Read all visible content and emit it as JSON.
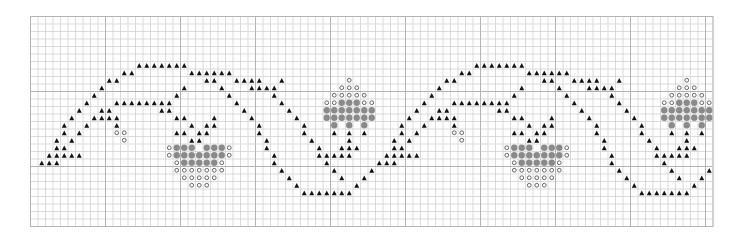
{
  "chart": {
    "columns": 91,
    "rows": 28,
    "cell_size": 7.5,
    "major_every": 10,
    "colors": {
      "background": "#ffffff",
      "grid_minor": "#d2d2d2",
      "grid_major": "#b4b4b4",
      "triangle": "#111111",
      "dot": "#8a8a8a",
      "circle_stroke": "#555555"
    },
    "legend": {
      "triangle": "black triangle stitch",
      "dot": "grey filled dot stitch",
      "circle": "open circle stitch"
    },
    "repeat_offsets": [
      0,
      45
    ],
    "motif": {
      "triangles": {
        "6": [
          14,
          15,
          16,
          17,
          18,
          19,
          20
        ],
        "7": [
          12,
          13,
          21,
          22,
          23,
          24,
          25,
          26
        ],
        "8": [
          10,
          11,
          23,
          24,
          27,
          28,
          29,
          30,
          33
        ],
        "9": [
          9,
          20,
          25,
          29,
          30,
          31,
          32
        ],
        "10": [
          8,
          19,
          26,
          32
        ],
        "11": [
          7,
          11,
          12,
          13,
          14,
          15,
          16,
          17,
          18,
          27,
          33
        ],
        "12": [
          6,
          9,
          10,
          17,
          18,
          28,
          34
        ],
        "13": [
          5,
          8,
          9,
          10,
          11,
          19,
          20,
          24,
          29,
          35
        ],
        "14": [
          4,
          7,
          11,
          21,
          23,
          24,
          30,
          36
        ],
        "15": [
          4,
          6,
          19,
          20,
          22,
          23,
          30,
          36,
          40,
          42,
          44
        ],
        "16": [
          3,
          5,
          21,
          22,
          31,
          37,
          42
        ],
        "17": [
          3,
          4,
          31,
          38,
          41,
          42,
          43
        ],
        "18": [
          2,
          3,
          4,
          5,
          6,
          32,
          38,
          39,
          40,
          41,
          42
        ],
        "19": [
          1,
          2,
          3,
          32,
          39
        ],
        "20": [
          33,
          40,
          45
        ],
        "21": [
          34,
          41,
          44
        ],
        "22": [
          35,
          43
        ],
        "23": [
          36,
          37,
          38,
          39,
          40,
          41,
          42
        ]
      },
      "dots": {
        "11": [
          41,
          42,
          43
        ],
        "12": [
          39,
          40,
          41,
          42,
          43,
          44,
          45
        ],
        "13": [
          39,
          40,
          41,
          42,
          43,
          44,
          45
        ],
        "14": [
          40,
          42,
          44
        ],
        "17": [
          19,
          20,
          21,
          23,
          24,
          25
        ],
        "18": [
          19,
          20,
          21,
          22,
          23,
          24,
          25
        ],
        "19": [
          20,
          21,
          22,
          23,
          24
        ]
      },
      "circles": {
        "8": [
          42
        ],
        "9": [
          41,
          42,
          43
        ],
        "10": [
          40,
          41,
          42,
          43,
          44
        ],
        "11": [
          39,
          40,
          44,
          45
        ],
        "15": [
          11,
          12
        ],
        "16": [
          12
        ],
        "17": [
          18,
          26
        ],
        "18": [
          18,
          26
        ],
        "19": [
          19,
          25
        ],
        "20": [
          19,
          20,
          21,
          22,
          23,
          24,
          25
        ],
        "21": [
          20,
          21,
          22,
          23,
          24
        ],
        "22": [
          21,
          22,
          23
        ]
      }
    }
  },
  "chart_data": {
    "type": "heatmap",
    "title": "",
    "grid": {
      "columns": 91,
      "rows": 28
    },
    "symbols": [
      "triangle",
      "dot",
      "circle"
    ],
    "repeat_offsets": [
      0,
      45
    ],
    "xlabel": "",
    "ylabel": "",
    "grid_lines": true
  }
}
